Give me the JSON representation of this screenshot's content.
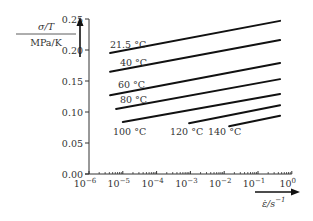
{
  "chart_data": {
    "type": "line",
    "title": "",
    "xlabel": "ε̇/s⁻¹",
    "ylabel": "σ/T  MPa/K",
    "xscale": "log",
    "xlim": [
      1e-06,
      1
    ],
    "ylim": [
      0,
      0.25
    ],
    "grid": false,
    "legend": "inline labels",
    "x_ticks": [
      "10^-6",
      "10^-5",
      "10^-4",
      "10^-3",
      "10^-2",
      "10^-1",
      "10^0"
    ],
    "y_ticks": [
      "0.00",
      "0.05",
      "0.10",
      "0.15",
      "0.20",
      "0.25"
    ],
    "series": [
      {
        "name": "21.5 °C",
        "x": [
          4.2e-06,
          0.45
        ],
        "y": [
          0.195,
          0.247
        ]
      },
      {
        "name": "40 °C",
        "x": [
          4.2e-06,
          0.45
        ],
        "y": [
          0.165,
          0.216
        ]
      },
      {
        "name": "60 °C",
        "x": [
          4.2e-06,
          0.45
        ],
        "y": [
          0.127,
          0.179
        ]
      },
      {
        "name": "80 °C",
        "x": [
          6.3e-06,
          0.45
        ],
        "y": [
          0.105,
          0.153
        ]
      },
      {
        "name": "100 °C",
        "x": [
          1e-05,
          0.45
        ],
        "y": [
          0.084,
          0.129
        ]
      },
      {
        "name": "120 °C",
        "x": [
          0.00091,
          0.45
        ],
        "y": [
          0.082,
          0.111
        ]
      },
      {
        "name": "140 °C",
        "x": [
          0.014,
          0.45
        ],
        "y": [
          0.077,
          0.094
        ]
      }
    ]
  },
  "labels": {
    "y_num": "σ/T",
    "y_den": "MPa/K",
    "x_label": "ε̇/s",
    "x_sup": "−1"
  }
}
